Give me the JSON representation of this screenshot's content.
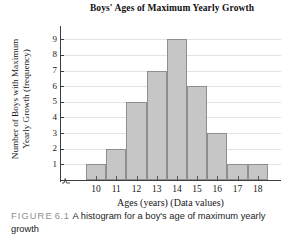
{
  "chart_data": {
    "type": "bar",
    "title": "Boys' Ages of Maximum Yearly Growth",
    "xlabel": "Ages (years) (Data values)",
    "ylabel": "Number of Boys with Maximum Yearly Growth (frequency)",
    "ylabel_line1": "Number of Boys with Maximum",
    "ylabel_line2": "Yearly Growth (frequency)",
    "categories": [
      "10",
      "11",
      "12",
      "13",
      "14",
      "15",
      "16",
      "17",
      "18"
    ],
    "values": [
      1,
      2,
      5,
      7,
      9,
      6,
      3,
      1,
      1
    ],
    "ytick_labels": [
      "9",
      "8",
      "7",
      "6",
      "5",
      "4",
      "3",
      "2",
      "1"
    ],
    "yticks": [
      9,
      8,
      7,
      6,
      5,
      4,
      3,
      2,
      1
    ],
    "ylim": [
      0,
      9
    ],
    "xlim_categories": 9,
    "grid": true,
    "legend": false,
    "bar_fill_color": "#c6c6c6",
    "bar_border_color": "#8e8e8e",
    "gridline_color": "#e2e2e2",
    "axis_color": "#3d3d3d"
  },
  "caption": {
    "figure_label": "FIGURE",
    "figure_number": "6.1",
    "text": "A histogram for a boy's age of maximum yearly growth"
  }
}
